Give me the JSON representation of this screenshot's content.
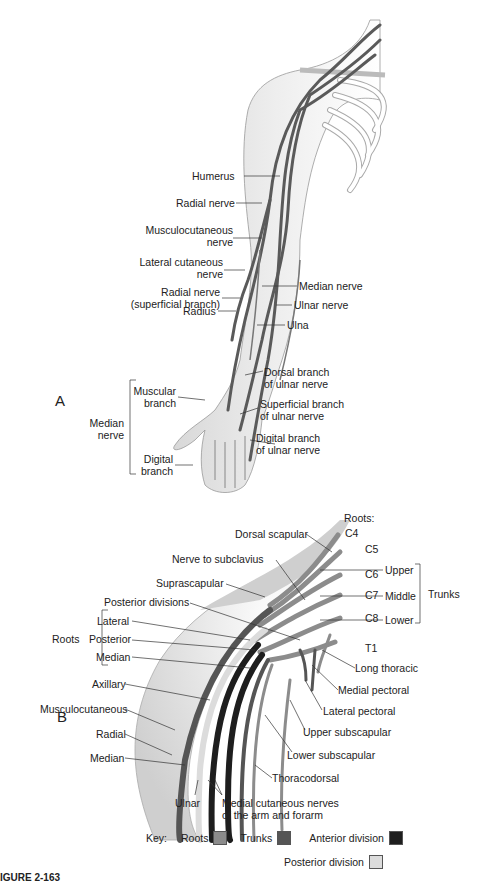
{
  "panel_a": {
    "letter": "A",
    "labels": {
      "humerus": "Humerus",
      "radial_nerve": "Radial nerve",
      "musculocutaneous_nerve_1": "Musculocutaneous",
      "musculocutaneous_nerve_2": "nerve",
      "lateral_cutaneous_1": "Lateral cutaneous",
      "lateral_cutaneous_2": "nerve",
      "radial_superficial_1": "Radial nerve",
      "radial_superficial_2": "(superficial branch)",
      "radius": "Radius",
      "median_nerve": "Median nerve",
      "ulnar_nerve": "Ulnar nerve",
      "ulna": "Ulna",
      "dorsal_branch_1": "Dorsal branch",
      "dorsal_branch_2": "of ulnar nerve",
      "superficial_branch_1": "Superficial branch",
      "superficial_branch_2": "of ulnar nerve",
      "digital_branch_ulnar_1": "Digital branch",
      "digital_branch_ulnar_2": "of ulnar nerve",
      "muscular_branch_1": "Muscular",
      "muscular_branch_2": "branch",
      "median_group_1": "Median",
      "median_group_2": "nerve",
      "digital_branch_1": "Digital",
      "digital_branch_2": "branch"
    }
  },
  "panel_b": {
    "letter": "B",
    "roots_header": "Roots:",
    "roots": [
      "C4",
      "C5",
      "C6",
      "C7",
      "C8",
      "T1"
    ],
    "trunks": [
      "Upper",
      "Middle",
      "Lower"
    ],
    "trunks_group": "Trunks",
    "roots_group": "Roots",
    "cords": [
      "Lateral",
      "Posterior",
      "Median"
    ],
    "labels": {
      "dorsal_scapular": "Dorsal scapular",
      "nerve_to_subclavius": "Nerve to subclavius",
      "suprascapular": "Suprascapular",
      "posterior_divisions": "Posterior divisions",
      "axillary": "Axillary",
      "musculocutaneous": "Musculocutaneous",
      "radial": "Radial",
      "median": "Median",
      "ulnar": "Ulnar",
      "medial_cutaneous_1": "Medial cutaneous nerves",
      "medial_cutaneous_2": "of the arm and forarm",
      "long_thoracic": "Long thoracic",
      "medial_pectoral": "Medial pectoral",
      "lateral_pectoral": "Lateral pectoral",
      "upper_subscapular": "Upper subscapular",
      "lower_subscapular": "Lower subscapular",
      "thoracodorsal": "Thoracodorsal"
    }
  },
  "key": {
    "title": "Key:",
    "items": [
      {
        "label": "Roots",
        "color": "#8c8c8c"
      },
      {
        "label": "Trunks",
        "color": "#555555"
      },
      {
        "label": "Anterior division",
        "color": "#1e1e1e"
      },
      {
        "label": "Posterior division",
        "color": "#dcdcdc"
      }
    ]
  },
  "caption": "IGURE 2-163"
}
